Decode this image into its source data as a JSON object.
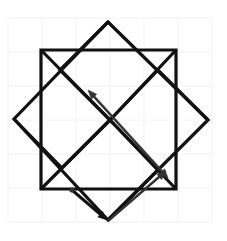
{
  "figure": {
    "canvas": {
      "width": 227,
      "height": 241,
      "background": "#ffffff"
    },
    "colors": {
      "grid": "#f2f2f2",
      "shape_stroke": "#111111",
      "arrow_stroke": "#1a1a1a",
      "arrow_stroke_light": "#555555",
      "background": "#ffffff"
    },
    "grid": {
      "label": "light gray square grid",
      "spacing": 34,
      "origin_x": 8,
      "origin_y": 18,
      "columns": 6,
      "rows": 6,
      "x_lines": [
        8,
        42,
        76,
        110,
        144,
        178,
        212
      ],
      "y_lines": [
        18,
        52,
        86,
        120,
        154,
        188,
        222
      ],
      "visible": true,
      "stroke_width": 1
    },
    "center": {
      "x": 110,
      "y": 120,
      "label": "common center point"
    },
    "shapes": [
      {
        "name": "axis-aligned-square",
        "type": "square",
        "rotation_deg": 0,
        "stroke_width": 3.2,
        "points": "41,50 176,50 176,189 41,189"
      },
      {
        "name": "rotated-square",
        "type": "square",
        "rotation_deg": 45,
        "stroke_width": 3.2,
        "points": "108,22 208,120 108,220 14,119"
      },
      {
        "name": "pinwheel-blade-upper-left",
        "type": "polyline",
        "stroke_width": 3.2,
        "points": "41,50 110,120"
      },
      {
        "name": "pinwheel-blade-upper-right",
        "type": "polyline",
        "stroke_width": 3.2,
        "points": "176,50 110,120"
      },
      {
        "name": "pinwheel-blade-lower-right",
        "type": "polyline",
        "stroke_width": 3.2,
        "points": "176,189 110,120"
      },
      {
        "name": "pinwheel-blade-lower-left",
        "type": "polyline",
        "stroke_width": 3.2,
        "points": "41,189 110,120"
      },
      {
        "name": "inner-chevron-left",
        "type": "polyline",
        "stroke_width": 3.2,
        "points": "14,119 62,168 110,120"
      },
      {
        "name": "inner-chevron-top",
        "type": "polyline",
        "stroke_width": 3.2,
        "points": "108,22 60,70 110,120"
      },
      {
        "name": "inner-chevron-right",
        "type": "polyline",
        "stroke_width": 3.2,
        "points": "208,120 158,70 110,120"
      },
      {
        "name": "inner-chevron-bottom",
        "type": "polyline",
        "stroke_width": 3.2,
        "points": "108,220 158,170 110,120"
      }
    ],
    "arrows": [
      {
        "name": "long-diagonal-arrow",
        "label": "double-headed diagonal arrow through center",
        "from": {
          "x": 168,
          "y": 178
        },
        "to": {
          "x": 88,
          "y": 90
        },
        "heads": "both",
        "stroke_width": 2.4,
        "color": "#333333"
      },
      {
        "name": "short-arrow-down-right",
        "label": "short arrow pointing down-right",
        "from": {
          "x": 72,
          "y": 190
        },
        "to": {
          "x": 107,
          "y": 220
        },
        "heads": "end",
        "stroke_width": 3.0,
        "color": "#111111"
      },
      {
        "name": "short-arrow-up-right",
        "label": "short arrow pointing up-right",
        "from": {
          "x": 108,
          "y": 221
        },
        "to": {
          "x": 166,
          "y": 171
        },
        "heads": "end",
        "stroke_width": 2.4,
        "color": "#333333"
      }
    ],
    "markers": [
      {
        "name": "origin-dot",
        "x": 72,
        "y": 190,
        "r": 2.6,
        "color": "#333333"
      }
    ]
  }
}
